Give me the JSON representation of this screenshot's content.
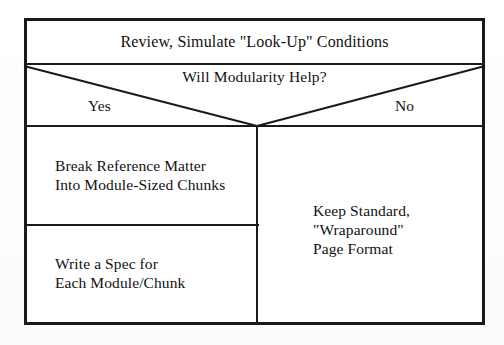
{
  "document": {
    "type": "flowchart",
    "background_color": "#ffffff",
    "line_color": "#1a1a1a",
    "text_color": "#111111"
  },
  "flowchart": {
    "title_box": {
      "label": "Review, Simulate \"Look-Up\" Conditions"
    },
    "decision_box": {
      "question": "Will Modularity Help?",
      "yes_label": "Yes",
      "no_label": "No"
    },
    "yes_branch": {
      "steps": [
        {
          "line1": "Break Reference Matter",
          "line2": "Into Module-Sized Chunks"
        },
        {
          "line1": "Write a Spec for",
          "line2": "Each Module/Chunk"
        }
      ]
    },
    "no_branch": {
      "outcome": {
        "line1": "Keep Standard,",
        "line2": "\"Wraparound\"",
        "line3": "Page Format"
      }
    }
  }
}
